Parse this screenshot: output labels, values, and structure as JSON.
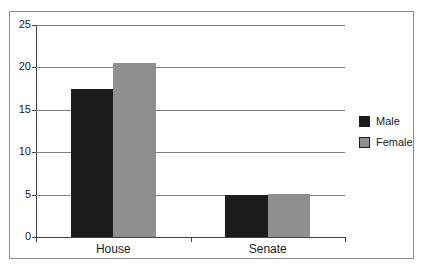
{
  "chart_data": {
    "type": "bar",
    "title": "",
    "xlabel": "",
    "ylabel": "",
    "categories": [
      "House",
      "Senate"
    ],
    "series": [
      {
        "name": "Male",
        "color": "#1c1c1c",
        "values": [
          17.5,
          5
        ]
      },
      {
        "name": "Female",
        "color": "#8f8f8f",
        "values": [
          20.5,
          5.1
        ]
      }
    ],
    "ylim": [
      0,
      25
    ],
    "ytick_step": 5,
    "ytick_labels": [
      "0",
      "5",
      "10",
      "15",
      "20",
      "25"
    ],
    "grid": true,
    "legend_position": "right"
  },
  "colors": {
    "male_series": "#1c1c1c",
    "female_series": "#8f8f8f",
    "gridline": "#808080",
    "axis": "#404040",
    "frame_border": "#8c8c8c",
    "background": "#ffffff",
    "text": "#1a1a1a"
  }
}
